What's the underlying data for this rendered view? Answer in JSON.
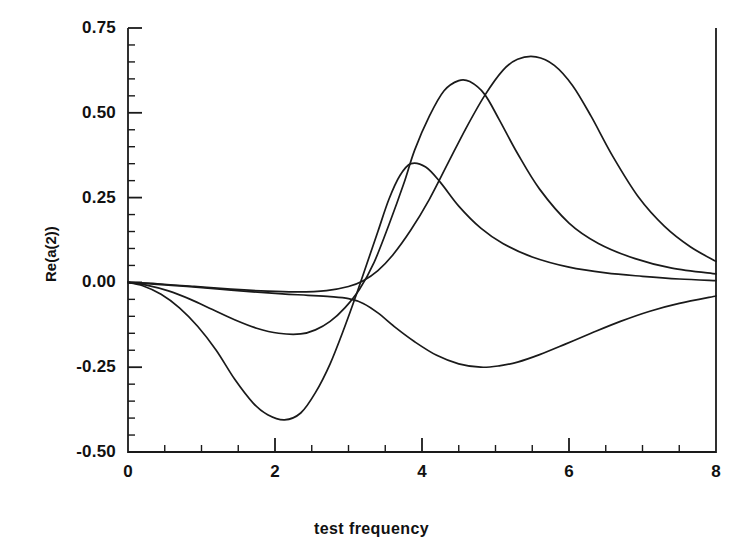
{
  "chart_data": {
    "type": "line",
    "title": "",
    "xlabel": "test frequency",
    "ylabel": "Re(a(2))",
    "xlim": [
      0,
      8
    ],
    "ylim": [
      -0.5,
      0.75
    ],
    "grid": false,
    "legend": null,
    "x_ticks": [
      0,
      2,
      4,
      6,
      8
    ],
    "x_tick_labels": [
      "0",
      "2",
      "4",
      "6",
      "8"
    ],
    "x_minor_tick_step": 0.5,
    "y_ticks": [
      -0.5,
      -0.25,
      0.0,
      0.25,
      0.5,
      0.75
    ],
    "y_tick_labels": [
      "-0.50",
      "-0.25",
      "0.00",
      "0.25",
      "0.50",
      "0.75"
    ],
    "y_minor_tick_step": 0.05,
    "line_color": "#1a1a1a",
    "line_width": 1.7,
    "background": "#ffffff",
    "series": [
      {
        "name": "curve-1",
        "x": [
          0.0,
          0.2,
          0.45,
          0.7,
          0.95,
          1.2,
          1.45,
          1.7,
          1.9,
          2.13,
          2.35,
          2.55,
          2.75,
          2.95,
          3.1,
          3.25,
          3.4,
          3.55,
          3.7,
          3.85,
          4.05,
          4.25,
          4.5,
          4.8,
          5.1,
          5.5,
          6.0,
          6.5,
          7.0,
          7.5,
          8.0
        ],
        "y": [
          0.0,
          -0.01,
          -0.035,
          -0.075,
          -0.13,
          -0.2,
          -0.285,
          -0.355,
          -0.39,
          -0.405,
          -0.385,
          -0.325,
          -0.24,
          -0.13,
          -0.04,
          0.055,
          0.15,
          0.245,
          0.315,
          0.35,
          0.34,
          0.295,
          0.225,
          0.16,
          0.115,
          0.075,
          0.045,
          0.028,
          0.018,
          0.01,
          0.005
        ]
      },
      {
        "name": "curve-2",
        "x": [
          0.0,
          0.25,
          0.55,
          0.85,
          1.15,
          1.45,
          1.75,
          2.05,
          2.35,
          2.55,
          2.75,
          2.95,
          3.15,
          3.35,
          3.55,
          3.75,
          3.9,
          4.1,
          4.3,
          4.5,
          4.65,
          4.85,
          5.05,
          5.3,
          5.6,
          6.0,
          6.4,
          6.9,
          7.4,
          8.0
        ],
        "y": [
          0.0,
          -0.008,
          -0.025,
          -0.05,
          -0.08,
          -0.11,
          -0.135,
          -0.15,
          -0.152,
          -0.14,
          -0.115,
          -0.075,
          -0.02,
          0.06,
          0.17,
          0.29,
          0.39,
          0.49,
          0.565,
          0.595,
          0.592,
          0.555,
          0.48,
          0.38,
          0.275,
          0.175,
          0.115,
          0.07,
          0.042,
          0.025
        ]
      },
      {
        "name": "curve-3",
        "x": [
          0.0,
          0.4,
          0.9,
          1.4,
          1.9,
          2.3,
          2.7,
          3.0,
          3.2,
          3.4,
          3.6,
          3.85,
          4.1,
          4.35,
          4.6,
          4.85,
          5.1,
          5.3,
          5.55,
          5.8,
          6.05,
          6.3,
          6.6,
          6.95,
          7.3,
          7.65,
          8.0
        ],
        "y": [
          0.0,
          -0.004,
          -0.012,
          -0.02,
          -0.026,
          -0.028,
          -0.024,
          -0.012,
          0.005,
          0.035,
          0.08,
          0.155,
          0.245,
          0.35,
          0.455,
          0.55,
          0.625,
          0.658,
          0.665,
          0.64,
          0.58,
          0.49,
          0.37,
          0.25,
          0.165,
          0.105,
          0.062
        ]
      },
      {
        "name": "curve-4",
        "x": [
          0.0,
          0.35,
          0.8,
          1.25,
          1.7,
          2.1,
          2.45,
          2.75,
          3.0,
          3.2,
          3.4,
          3.65,
          3.9,
          4.2,
          4.5,
          4.8,
          5.05,
          5.3,
          5.6,
          5.95,
          6.3,
          6.7,
          7.1,
          7.5,
          8.0
        ],
        "y": [
          0.0,
          -0.005,
          -0.012,
          -0.02,
          -0.028,
          -0.034,
          -0.038,
          -0.042,
          -0.048,
          -0.062,
          -0.09,
          -0.135,
          -0.175,
          -0.215,
          -0.24,
          -0.25,
          -0.246,
          -0.235,
          -0.213,
          -0.182,
          -0.15,
          -0.115,
          -0.085,
          -0.062,
          -0.04
        ]
      }
    ]
  },
  "axis_geometry": {
    "left_px": 128,
    "right_px": 716,
    "top_px": 28,
    "bottom_px": 452
  }
}
